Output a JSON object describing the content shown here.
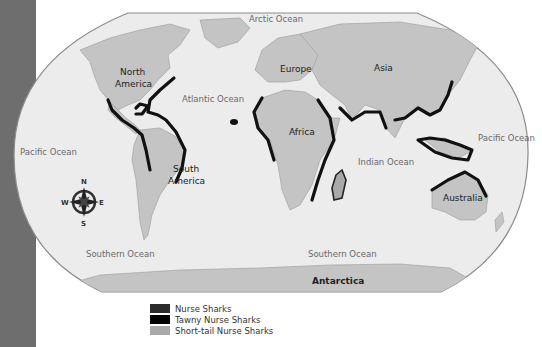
{
  "map": {
    "projection": "world",
    "labels": {
      "oceans": {
        "arctic": "Arctic Ocean",
        "atlantic": "Atlantic Ocean",
        "pacific_west": "Pacific Ocean",
        "pacific_east": "Pacific Ocean",
        "indian": "Indian Ocean",
        "southern_west": "Southern Ocean",
        "southern_east": "Southern Ocean"
      },
      "continents": {
        "north_america_1": "North",
        "north_america_2": "America",
        "south_america_1": "South",
        "south_america_2": "America",
        "europe": "Europe",
        "asia": "Asia",
        "africa": "Africa",
        "australia": "Australia",
        "antarctica": "Antarctica"
      }
    },
    "compass": {
      "n": "N",
      "s": "S",
      "e": "E",
      "w": "W"
    },
    "colors": {
      "side_band": "#6e6e6e",
      "ocean": "#ececec",
      "land": "#c4c4c4",
      "nurse_sharks": "#2b2b2b",
      "tawny_nurse_sharks": "#000000",
      "short_tail_nurse_sharks": "#a9a9a9"
    }
  },
  "legend": {
    "items": [
      {
        "label": "Nurse Sharks",
        "color": "#2b2b2b"
      },
      {
        "label": "Tawny Nurse Sharks",
        "color": "#000000"
      },
      {
        "label": "Short-tail Nurse Sharks",
        "color": "#a9a9a9"
      }
    ]
  }
}
